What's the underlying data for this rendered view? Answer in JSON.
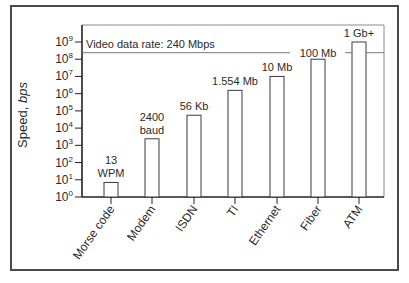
{
  "chart_data": {
    "type": "bar",
    "title": "",
    "xlabel": "",
    "ylabel": "Speed, bps",
    "ylabel_parts": {
      "main": "Speed, ",
      "italic": "bps"
    },
    "yscale": "log",
    "ylim": [
      1,
      1000000000
    ],
    "yticks": [
      {
        "exp": "0",
        "value": 1
      },
      {
        "exp": "1",
        "value": 10
      },
      {
        "exp": "2",
        "value": 100
      },
      {
        "exp": "3",
        "value": 1000
      },
      {
        "exp": "4",
        "value": 10000
      },
      {
        "exp": "5",
        "value": 100000
      },
      {
        "exp": "6",
        "value": 1000000
      },
      {
        "exp": "7",
        "value": 10000000
      },
      {
        "exp": "8",
        "value": 100000000
      },
      {
        "exp": "9",
        "value": 1000000000
      }
    ],
    "categories": [
      "Morse code",
      "Modem",
      "ISDN",
      "TI",
      "Ethernet",
      "Fiber",
      "ATM"
    ],
    "values": [
      7,
      2400,
      56000,
      1554000,
      10000000,
      100000000,
      1000000000
    ],
    "bar_labels": [
      [
        "13",
        "WPM"
      ],
      [
        "2400",
        "baud"
      ],
      [
        "56 Kb"
      ],
      [
        "1.554 Mb"
      ],
      [
        "10 Mb"
      ],
      [
        "100 Mb"
      ],
      [
        "1 Gb+"
      ]
    ],
    "reference_line": {
      "label": "Video data rate: 240 Mbps",
      "value": 240000000
    },
    "grid": false,
    "legend": null
  },
  "colors": {
    "frame": "#4a4a4a",
    "axis": "#222222",
    "bar_fill": "#ffffff",
    "bar_stroke": "#3a3a3a",
    "reference_line": "#777777",
    "text": "#2a2a2a"
  }
}
